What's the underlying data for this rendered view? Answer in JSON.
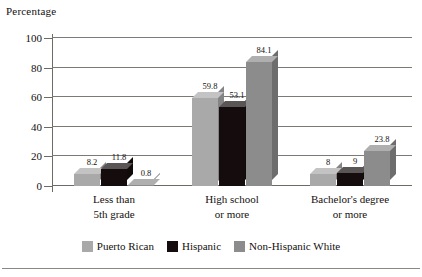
{
  "chart_data": {
    "type": "bar",
    "title": "Percentage",
    "xlabel": "",
    "ylabel": "Percentage",
    "ylim": [
      0,
      100
    ],
    "yticks": [
      0,
      20,
      40,
      60,
      80,
      100
    ],
    "grid": true,
    "legend_position": "bottom",
    "style": "3d-grouped-bar",
    "categories": [
      "Less than\n5th grade",
      "High school\nor more",
      "Bachelor's degree\nor more"
    ],
    "category_lines": [
      [
        "Less than",
        "5th grade"
      ],
      [
        "High school",
        "or more"
      ],
      [
        "Bachelor's degree",
        "or more"
      ]
    ],
    "series": [
      {
        "name": "Puerto Rican",
        "color": "#a9a9a9",
        "values": [
          8.2,
          59.8,
          8
        ],
        "labels": [
          "8.2",
          "59.8",
          "8"
        ]
      },
      {
        "name": "Hispanic",
        "color": "#150d0d",
        "values": [
          11.8,
          53.1,
          9
        ],
        "labels": [
          "11.8",
          "53.1",
          "9"
        ]
      },
      {
        "name": "Non-Hispanic White",
        "color": "#8c8c8c",
        "values": [
          0.8,
          84.1,
          23.8
        ],
        "labels": [
          "0.8",
          "84.1",
          "23.8"
        ]
      }
    ]
  },
  "axis": {
    "title": "Percentage",
    "tick_labels": [
      "100",
      "80",
      "60",
      "40",
      "20",
      "0"
    ]
  },
  "colors": {
    "puerto_rican": "#a9a9a9",
    "hispanic": "#150d0d",
    "non_hispanic_white": "#8c8c8c",
    "grid": "#7d7a76",
    "axis": "#6e6a66",
    "text": "#14100e"
  }
}
